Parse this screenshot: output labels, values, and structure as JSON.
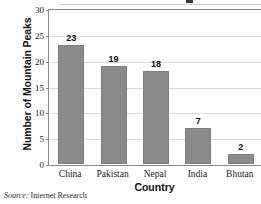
{
  "chart_data": {
    "type": "bar",
    "title": "",
    "categories": [
      "China",
      "Pakistan",
      "Nepal",
      "India",
      "Bhutan"
    ],
    "values": [
      23,
      19,
      18,
      7,
      2
    ],
    "xlabel": "Country",
    "ylabel": "Number of Mountain Peaks",
    "ylim": [
      0,
      30
    ],
    "ytick_labels": [
      "0",
      "5",
      "10",
      "15",
      "20",
      "25",
      "30"
    ],
    "ytick_values": [
      0,
      5,
      10,
      15,
      20,
      25,
      30
    ],
    "grid": true,
    "legend": false,
    "bar_color": "#8a8a8a",
    "grid_color": "#dcdcdc",
    "axis_color": "#8d8d8d"
  },
  "source": {
    "label": "Source:",
    "text": "Internet Research"
  }
}
